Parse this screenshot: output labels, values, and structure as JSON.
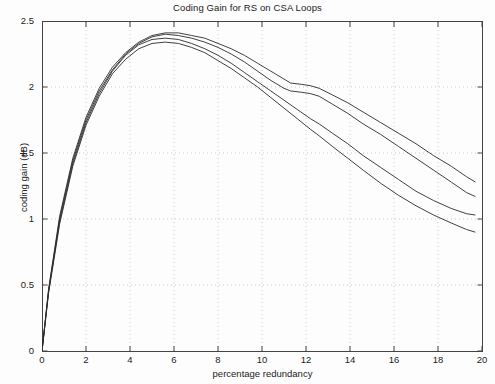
{
  "chart_data": {
    "type": "line",
    "title": "Coding Gain for RS on CSA Loops",
    "xlabel": "percentage redundancy",
    "ylabel": "coding gain (dB)",
    "xlim": [
      0,
      20
    ],
    "ylim": [
      0,
      2.5
    ],
    "xticks": [
      0,
      2,
      4,
      6,
      8,
      10,
      12,
      14,
      16,
      18,
      20
    ],
    "xtick_labels": [
      "0",
      "2",
      "4",
      "6",
      "8",
      "10",
      "12",
      "14",
      "16",
      "18",
      "20"
    ],
    "yticks": [
      0,
      0.5,
      1,
      1.5,
      2,
      2.5
    ],
    "ytick_labels": [
      "0",
      "0.5",
      "1",
      "1.5",
      "2",
      "2.5"
    ],
    "grid": "dotted",
    "legend": "none",
    "line_color": "#2b2b2b",
    "background_color": "#ffffff",
    "series": [
      {
        "name": "curve-1",
        "x": [
          0,
          0.3,
          0.8,
          1.4,
          2.0,
          2.6,
          3.2,
          3.8,
          4.4,
          5.0,
          5.6,
          6.2,
          6.8,
          7.4,
          8.0,
          8.6,
          9.2,
          9.8,
          10.4,
          11.0,
          11.3,
          11.8,
          12.2,
          12.6,
          13.2,
          13.9,
          14.6,
          15.4,
          16.2,
          17.0,
          17.8,
          18.6,
          19.3,
          19.7
        ],
        "values": [
          0.0,
          0.47,
          1.02,
          1.46,
          1.77,
          1.99,
          2.15,
          2.26,
          2.34,
          2.39,
          2.41,
          2.41,
          2.39,
          2.37,
          2.33,
          2.29,
          2.24,
          2.18,
          2.12,
          2.06,
          2.03,
          2.02,
          2.01,
          1.99,
          1.94,
          1.88,
          1.81,
          1.73,
          1.65,
          1.57,
          1.48,
          1.4,
          1.32,
          1.28
        ]
      },
      {
        "name": "curve-2",
        "x": [
          0,
          0.3,
          0.8,
          1.4,
          2.0,
          2.6,
          3.2,
          3.8,
          4.4,
          5.0,
          5.6,
          6.2,
          6.8,
          7.4,
          8.0,
          8.6,
          9.2,
          9.8,
          10.4,
          11.0,
          11.3,
          11.8,
          12.2,
          12.6,
          13.2,
          13.9,
          14.6,
          15.4,
          16.2,
          17.0,
          17.8,
          18.6,
          19.3,
          19.7
        ],
        "values": [
          0.0,
          0.46,
          1.0,
          1.44,
          1.75,
          1.97,
          2.13,
          2.25,
          2.33,
          2.38,
          2.4,
          2.39,
          2.37,
          2.34,
          2.3,
          2.25,
          2.19,
          2.12,
          2.05,
          1.99,
          1.97,
          1.96,
          1.95,
          1.93,
          1.87,
          1.8,
          1.72,
          1.64,
          1.55,
          1.46,
          1.37,
          1.28,
          1.2,
          1.17
        ]
      },
      {
        "name": "curve-3",
        "x": [
          0,
          0.3,
          0.8,
          1.4,
          2.0,
          2.6,
          3.2,
          3.8,
          4.4,
          5.0,
          5.6,
          6.2,
          6.8,
          7.4,
          8.0,
          8.6,
          9.2,
          9.8,
          10.4,
          11.0,
          11.6,
          12.2,
          12.6,
          13.2,
          13.9,
          14.6,
          15.4,
          16.2,
          17.0,
          17.8,
          18.6,
          19.3,
          19.7
        ],
        "values": [
          0.0,
          0.45,
          0.98,
          1.42,
          1.73,
          1.95,
          2.12,
          2.24,
          2.32,
          2.36,
          2.37,
          2.36,
          2.33,
          2.29,
          2.24,
          2.18,
          2.11,
          2.04,
          1.97,
          1.9,
          1.83,
          1.76,
          1.72,
          1.65,
          1.57,
          1.48,
          1.39,
          1.3,
          1.21,
          1.14,
          1.08,
          1.04,
          1.03
        ]
      },
      {
        "name": "curve-4",
        "x": [
          0,
          0.3,
          0.8,
          1.4,
          2.0,
          2.6,
          3.2,
          3.8,
          4.4,
          5.0,
          5.6,
          6.2,
          6.8,
          7.4,
          8.0,
          8.6,
          9.2,
          9.8,
          10.4,
          11.0,
          11.6,
          12.2,
          12.6,
          13.2,
          13.9,
          14.6,
          15.4,
          16.2,
          17.0,
          17.8,
          18.6,
          19.3,
          19.7
        ],
        "values": [
          0.0,
          0.44,
          0.96,
          1.4,
          1.71,
          1.93,
          2.1,
          2.21,
          2.29,
          2.33,
          2.34,
          2.33,
          2.3,
          2.26,
          2.2,
          2.14,
          2.07,
          2.0,
          1.92,
          1.84,
          1.76,
          1.68,
          1.63,
          1.55,
          1.46,
          1.37,
          1.27,
          1.18,
          1.1,
          1.03,
          0.97,
          0.92,
          0.9
        ]
      }
    ]
  }
}
